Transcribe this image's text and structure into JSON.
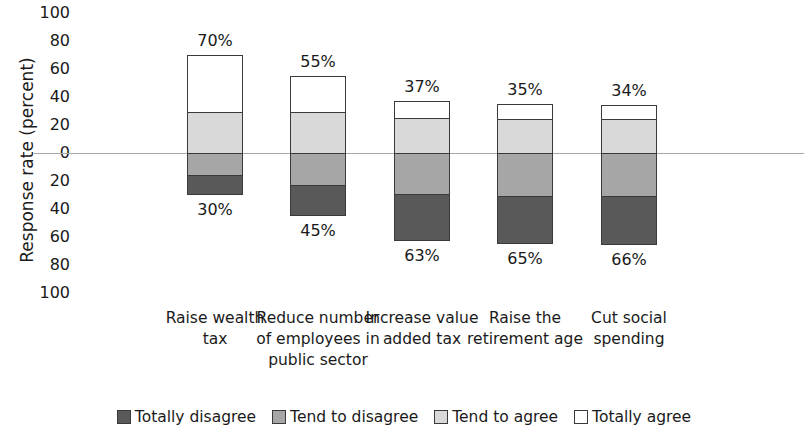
{
  "chart_data": {
    "type": "bar",
    "subtype": "diverging-stacked-bar",
    "title": "",
    "xlabel": "",
    "ylabel": "Response rate (percent)",
    "ylim": [
      -100,
      100
    ],
    "y_ticks": [
      100,
      80,
      60,
      40,
      20,
      0,
      20,
      40,
      60,
      80,
      100
    ],
    "grid": false,
    "zero_line": true,
    "legend_position": "bottom",
    "categories": [
      "Raise wealth tax",
      "Reduce number of employees in public sector",
      "Increase value added tax",
      "Raise the retirement age",
      "Cut social spending"
    ],
    "series": [
      {
        "name": "Totally disagree",
        "color": "#595959",
        "direction": "down",
        "values": [
          14,
          22,
          34,
          34,
          35
        ]
      },
      {
        "name": "Tend to disagree",
        "color": "#a6a6a6",
        "direction": "down",
        "values": [
          16,
          23,
          29,
          31,
          31
        ]
      },
      {
        "name": "Tend to agree",
        "color": "#d9d9d9",
        "direction": "up",
        "values": [
          29,
          29,
          25,
          24,
          24
        ]
      },
      {
        "name": "Totally agree",
        "color": "#ffffff",
        "direction": "up",
        "values": [
          41,
          26,
          12,
          11,
          10
        ]
      }
    ],
    "agree_totals": [
      70,
      55,
      37,
      35,
      34
    ],
    "disagree_totals": [
      30,
      45,
      63,
      65,
      66
    ],
    "agree_labels": [
      "70%",
      "55%",
      "37%",
      "35%",
      "34%"
    ],
    "disagree_labels": [
      "30%",
      "45%",
      "63%",
      "65%",
      "66%"
    ]
  },
  "axis": {
    "y_title": "Response rate (percent)",
    "ticks": [
      {
        "label": "100"
      },
      {
        "label": "80"
      },
      {
        "label": "60"
      },
      {
        "label": "40"
      },
      {
        "label": "20"
      },
      {
        "label": "0"
      },
      {
        "label": "20"
      },
      {
        "label": "40"
      },
      {
        "label": "60"
      },
      {
        "label": "80"
      },
      {
        "label": "100"
      }
    ]
  },
  "bars": [
    {
      "category": "Raise wealth tax",
      "agree_label": "70%",
      "disagree_label": "30%",
      "totally_agree": 41,
      "tend_agree": 29,
      "tend_disagree": 16,
      "totally_disagree": 14
    },
    {
      "category": "Reduce number of employees in public sector",
      "agree_label": "55%",
      "disagree_label": "45%",
      "totally_agree": 26,
      "tend_agree": 29,
      "tend_disagree": 23,
      "totally_disagree": 22
    },
    {
      "category": "Increase value added tax",
      "agree_label": "37%",
      "disagree_label": "63%",
      "totally_agree": 12,
      "tend_agree": 25,
      "tend_disagree": 29,
      "totally_disagree": 34
    },
    {
      "category": "Raise the retirement age",
      "agree_label": "35%",
      "disagree_label": "65%",
      "totally_agree": 11,
      "tend_agree": 24,
      "tend_disagree": 31,
      "totally_disagree": 34
    },
    {
      "category": "Cut social spending",
      "agree_label": "34%",
      "disagree_label": "66%",
      "totally_agree": 10,
      "tend_agree": 24,
      "tend_disagree": 31,
      "totally_disagree": 35
    }
  ],
  "category_labels": [
    "Raise wealth\ntax",
    "Reduce number\nof employees in\npublic sector",
    "Increase value\nadded tax",
    "Raise the\nretirement age",
    "Cut social\nspending"
  ],
  "legend": {
    "items": [
      {
        "label": "Totally disagree",
        "color": "#595959",
        "swatch_class": "sw-totally-disagree"
      },
      {
        "label": "Tend to disagree",
        "color": "#a6a6a6",
        "swatch_class": "sw-tend-disagree"
      },
      {
        "label": "Tend to agree",
        "color": "#d9d9d9",
        "swatch_class": "sw-tend-agree"
      },
      {
        "label": "Totally agree",
        "color": "#ffffff",
        "swatch_class": "sw-totally-agree"
      }
    ]
  }
}
